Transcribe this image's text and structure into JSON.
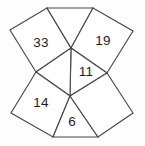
{
  "figure": {
    "type": "polygon-net-puzzle",
    "canvas": {
      "width": 145,
      "height": 146
    },
    "colors": {
      "background": "#fdfdfd",
      "face_fill": "#ffffff",
      "stroke": "#474747",
      "text": "#1d1d1d"
    },
    "vertices": {
      "top_left_edge": [
        47,
        8
      ],
      "top_right_edge": [
        93,
        8
      ],
      "far_left_top": [
        10,
        30
      ],
      "far_right_top": [
        133,
        31
      ],
      "left_mid": [
        36,
        72
      ],
      "right_mid": [
        107,
        73
      ],
      "center_top": [
        71,
        48
      ],
      "center_bottom": [
        70,
        96
      ],
      "far_left_bottom": [
        11,
        113
      ],
      "far_right_bottom": [
        133,
        113
      ],
      "bottom_left_edge": [
        53,
        137
      ],
      "bottom_right_edge": [
        98,
        137
      ]
    },
    "faces": [
      {
        "id": "face-33",
        "name": "upper-left-quad",
        "label": "33",
        "label_x": 41,
        "label_y": 43,
        "points": "10,30 47,8 71,48 36,72"
      },
      {
        "id": "face-top",
        "name": "top-triangle-quad",
        "label": "",
        "label_x": 71,
        "label_y": 26,
        "points": "47,8 93,8 71,48"
      },
      {
        "id": "face-19",
        "name": "upper-right-quad",
        "label": "19",
        "label_x": 103,
        "label_y": 41,
        "points": "93,8 133,31 107,73 71,48"
      },
      {
        "id": "face-11",
        "name": "center-rhombus",
        "label": "11",
        "label_x": 86,
        "label_y": 72,
        "points": "71,48 107,73 70,96"
      },
      {
        "id": "face-left-rhombus",
        "name": "center-left-rhombus",
        "label": "",
        "label_x": 57,
        "label_y": 72,
        "points": "71,48 70,96 36,72"
      },
      {
        "id": "face-14",
        "name": "lower-left-quad",
        "label": "14",
        "label_x": 41,
        "label_y": 103,
        "points": "36,72 70,96 53,137 11,113"
      },
      {
        "id": "face-6",
        "name": "bottom-triangle-quad",
        "label": "6",
        "label_x": 72,
        "label_y": 122,
        "points": "70,96 98,137 53,137"
      },
      {
        "id": "face-lower-right",
        "name": "lower-right-quad",
        "label": "",
        "label_x": 104,
        "label_y": 104,
        "points": "70,96 107,73 133,113 98,137"
      }
    ],
    "labels": [
      {
        "text": "33",
        "face": "upper-left-quad"
      },
      {
        "text": "19",
        "face": "upper-right-quad"
      },
      {
        "text": "11",
        "face": "center-rhombus"
      },
      {
        "text": "14",
        "face": "lower-left-quad"
      },
      {
        "text": "6",
        "face": "bottom-triangle-quad"
      }
    ]
  }
}
